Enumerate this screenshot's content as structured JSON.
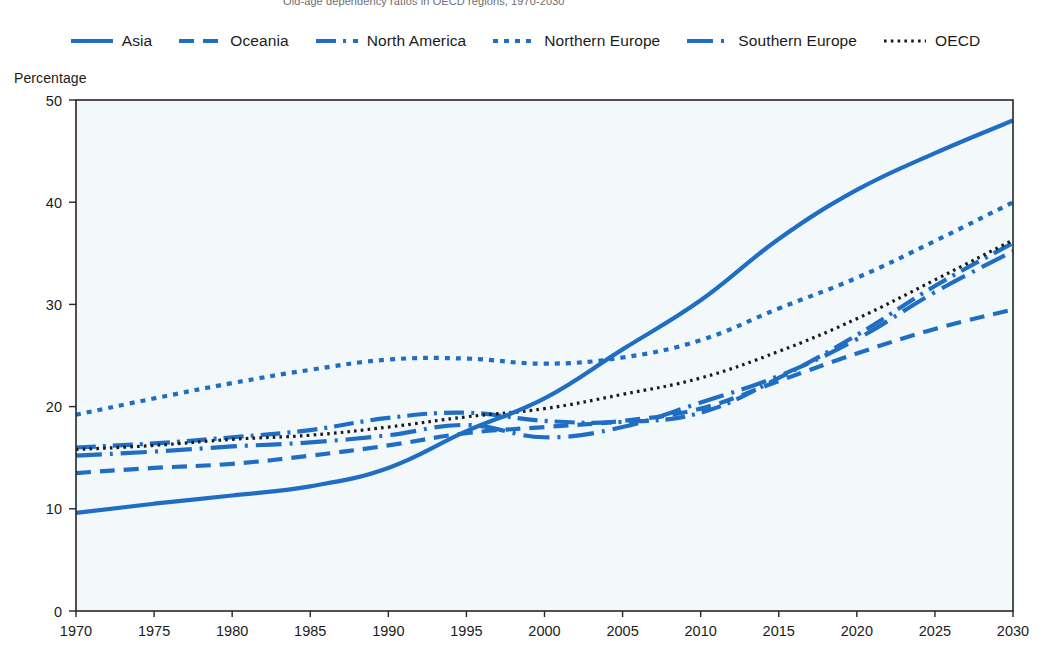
{
  "figure": {
    "title_clipped": "Old-age dependency ratios in OECD regions, 1970-2030",
    "axis_title": "Percentage"
  },
  "legend": {
    "position": "top-center",
    "items": [
      {
        "label": "Asia",
        "style": "solid",
        "color": "#1f6ec4"
      },
      {
        "label": "Oceania",
        "style": "dashed",
        "color": "#1f6ec4"
      },
      {
        "label": "North America",
        "style": "dash-dot",
        "color": "#1f6ec4"
      },
      {
        "label": "Northern Europe",
        "style": "dotted",
        "color": "#1f6ec4"
      },
      {
        "label": "Southern Europe",
        "style": "long-dash-dot",
        "color": "#1f6ec4"
      },
      {
        "label": "OECD",
        "style": "fine-dotted",
        "color": "#1a1a1a"
      }
    ]
  },
  "chart_data": {
    "type": "line",
    "title": "Old-age dependency ratios in OECD regions, 1970-2030",
    "xlabel": "",
    "ylabel": "Percentage",
    "xlim": [
      1970,
      2030
    ],
    "ylim": [
      0,
      50
    ],
    "ytick_values": [
      0,
      10,
      20,
      30,
      40,
      50
    ],
    "xtick_values": [
      1970,
      1975,
      1980,
      1985,
      1990,
      1995,
      2000,
      2005,
      2010,
      2015,
      2020,
      2025,
      2030
    ],
    "grid": false,
    "legend_position": "top-center",
    "x": [
      1970,
      1975,
      1980,
      1985,
      1990,
      1995,
      2000,
      2005,
      2010,
      2015,
      2020,
      2025,
      2030
    ],
    "series": [
      {
        "name": "Asia",
        "color": "#1f6ec4",
        "style": "solid",
        "values": [
          9.6,
          10.5,
          11.3,
          12.2,
          14.0,
          17.6,
          20.8,
          25.6,
          30.4,
          36.4,
          41.2,
          44.8,
          48.0
        ]
      },
      {
        "name": "Oceania",
        "color": "#1f6ec4",
        "style": "dashed",
        "values": [
          13.5,
          14.0,
          14.4,
          15.2,
          16.2,
          17.4,
          18.0,
          18.6,
          19.8,
          22.5,
          25.2,
          27.6,
          29.5
        ]
      },
      {
        "name": "North America",
        "color": "#1f6ec4",
        "style": "dash-dot",
        "values": [
          16.0,
          16.4,
          17.0,
          17.7,
          18.9,
          19.4,
          18.6,
          18.5,
          19.4,
          22.8,
          27.0,
          31.8,
          36.0
        ]
      },
      {
        "name": "Northern Europe",
        "color": "#1f6ec4",
        "style": "dotted",
        "values": [
          19.2,
          20.8,
          22.3,
          23.6,
          24.6,
          24.7,
          24.2,
          24.8,
          26.5,
          29.6,
          32.6,
          36.2,
          40.0
        ]
      },
      {
        "name": "Southern Europe",
        "color": "#1f6ec4",
        "style": "long-dash-dot",
        "values": [
          15.2,
          15.6,
          16.1,
          16.5,
          17.2,
          18.2,
          17.0,
          18.0,
          20.4,
          23.0,
          26.6,
          31.2,
          35.2
        ]
      },
      {
        "name": "OECD",
        "color": "#1a1a1a",
        "style": "fine-dotted",
        "values": [
          15.8,
          16.2,
          16.8,
          17.2,
          18.0,
          19.0,
          19.8,
          21.2,
          22.8,
          25.4,
          28.6,
          32.4,
          36.3
        ]
      }
    ]
  }
}
